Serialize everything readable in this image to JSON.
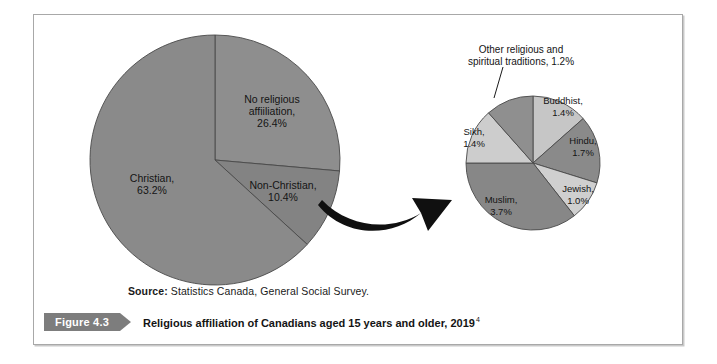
{
  "figure": {
    "badge_label": "Figure 4.3",
    "caption": "Religious affiliation of Canadians aged 15 years and older, 2019",
    "caption_footnote": "4",
    "source_label": "Source:",
    "source_text": " Statistics Canada, General Social Survey.",
    "badge_color": "#7d7d7d",
    "frame_color": "#a8a8a8"
  },
  "chart_data": [
    {
      "type": "pie",
      "name": "main-pie",
      "title": "Religious affiliation of Canadians aged 15 years and older, 2019",
      "unit": "%",
      "start_angle": 0,
      "direction": "clockwise",
      "center": [
        215,
        160
      ],
      "radius": 125,
      "categories": [
        "No religious affiliation",
        "Non-Christian",
        "Christian"
      ],
      "values": [
        26.4,
        10.4,
        63.2
      ],
      "colors": [
        "#8e8e8e",
        "#838383",
        "#8a8a8a"
      ],
      "slices": [
        {
          "label": "No religious affiiliation,",
          "label_lines": [
            "No religious",
            "affiiliation,",
            "26.4%"
          ],
          "value": 26.4,
          "value_text": "26.4%",
          "color": "#8e8e8e",
          "label_pos": [
            272,
            103
          ]
        },
        {
          "label": "Non-Christian,",
          "label_lines": [
            "Non-Christian,",
            "10.4%"
          ],
          "value": 10.4,
          "value_text": "10.4%",
          "color": "#838383",
          "label_pos": [
            283,
            189
          ]
        },
        {
          "label": "Christian,",
          "label_lines": [
            "Christian,",
            "63.2%"
          ],
          "value": 63.2,
          "value_text": "63.2%",
          "color": "#8a8a8a",
          "label_pos": [
            152,
            182
          ]
        }
      ]
    },
    {
      "type": "pie",
      "name": "breakout-pie",
      "title": "Non-Christian breakdown",
      "unit": "%",
      "start_angle": 0,
      "direction": "clockwise",
      "center": [
        533,
        163
      ],
      "radius": 67,
      "categories": [
        "Buddhist",
        "Hindu",
        "Jewish",
        "Muslim",
        "Sikh",
        "Other religious and spiritual traditions"
      ],
      "values": [
        1.4,
        1.7,
        1.0,
        3.7,
        1.4,
        1.2
      ],
      "colors": [
        "#c6c6c6",
        "#8a8a8a",
        "#cfcfcf",
        "#878787",
        "#cdcdcd",
        "#8f8f8f"
      ],
      "slices": [
        {
          "label": "Buddhist,",
          "label_lines": [
            "Buddhist,",
            "1.4%"
          ],
          "value": 1.4,
          "value_text": "1.4%",
          "color": "#c6c6c6",
          "label_pos": [
            563,
            104
          ]
        },
        {
          "label": "Hindu,",
          "label_lines": [
            "Hindu,",
            "1.7%"
          ],
          "value": 1.7,
          "value_text": "1.7%",
          "color": "#8a8a8a",
          "label_pos": [
            583,
            144
          ]
        },
        {
          "label": "Jewish,",
          "label_lines": [
            "Jewish,",
            "1.0%"
          ],
          "value": 1.0,
          "value_text": "1.0%",
          "color": "#cfcfcf",
          "label_pos": [
            578,
            192
          ]
        },
        {
          "label": "Muslim,",
          "label_lines": [
            "Muslim,",
            "3.7%"
          ],
          "value": 3.7,
          "value_text": "3.7%",
          "color": "#878787",
          "label_pos": [
            501,
            203
          ]
        },
        {
          "label": "Sikh,",
          "label_lines": [
            "Sikh,",
            "1.4%"
          ],
          "value": 1.4,
          "value_text": "1.4%",
          "color": "#cdcdcd",
          "label_pos": [
            474,
            135
          ]
        },
        {
          "label": "Other religious and spiritual traditions,",
          "label_lines": [
            "Other religious and",
            "spiritual traditions, 1.2%"
          ],
          "value": 1.2,
          "value_text": "1.2%",
          "color": "#8f8f8f",
          "callout": true,
          "label_pos": [
            521,
            53
          ]
        }
      ]
    }
  ],
  "annotations": {
    "callout_text_line1": "Other religious and",
    "callout_text_line2": "spiritual traditions, 1.2%",
    "arrow_name": "breakout-arrow"
  }
}
